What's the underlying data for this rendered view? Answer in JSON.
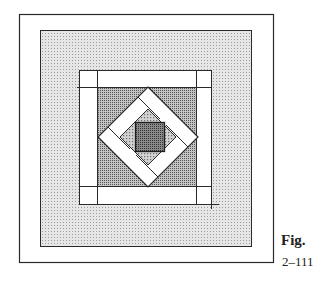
{
  "figure": {
    "caption_label": "Fig.",
    "caption_number": "2–111"
  },
  "colors": {
    "line": "#2a2a2a",
    "outer_gray": "#d8d8d8",
    "dark_gray": "#9a9a9a",
    "mid_gray": "#b8b8b8",
    "center": "#6e6e6e",
    "white": "#ffffff"
  }
}
